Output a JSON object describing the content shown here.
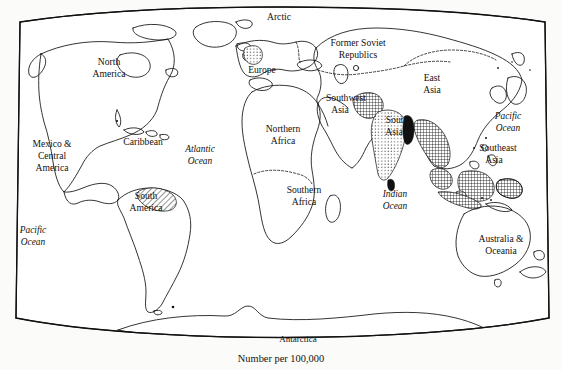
{
  "figure": {
    "type": "choropleth-world-map",
    "caption": "Number per 100,000",
    "projection": "elliptical",
    "background_color": "#fbfbf9",
    "line_color": "#111111"
  },
  "regions": [
    {
      "id": "arctic",
      "label": "Arctic",
      "line1": "Arctic",
      "line2": "",
      "x": 279,
      "y": 18,
      "shading": "none"
    },
    {
      "id": "north-america",
      "label": "North America",
      "line1": "North",
      "line2": "America",
      "x": 109,
      "y": 68,
      "shading": "none"
    },
    {
      "id": "europe",
      "label": "Europe",
      "line1": "Europe",
      "line2": "",
      "x": 259,
      "y": 71,
      "shading": "stipple"
    },
    {
      "id": "former-soviet",
      "label": "Former Soviet Republics",
      "line1": "Former Soviet",
      "line2": "Republics",
      "x": 358,
      "y": 49,
      "shading": "none"
    },
    {
      "id": "east-asia",
      "label": "East Asia",
      "line1": "East",
      "line2": "Asia",
      "x": 432,
      "y": 84,
      "shading": "none"
    },
    {
      "id": "mexico-central",
      "label": "Mexico & Central America",
      "line1": "Mexico &",
      "line2": "Central",
      "line3": "America",
      "x": 52,
      "y": 155,
      "shading": "none"
    },
    {
      "id": "caribbean",
      "label": "Caribbean",
      "line1": "Caribbean",
      "line2": "",
      "x": 143,
      "y": 143,
      "shading": "none"
    },
    {
      "id": "south-america",
      "label": "South America",
      "line1": "South",
      "line2": "America",
      "x": 146,
      "y": 203,
      "shading": "diagonal-hatch"
    },
    {
      "id": "northern-africa",
      "label": "Northern Africa",
      "line1": "Northern",
      "line2": "Africa",
      "x": 283,
      "y": 135,
      "shading": "none"
    },
    {
      "id": "southern-africa",
      "label": "Southern Africa",
      "line1": "Southern",
      "line2": "Africa",
      "x": 304,
      "y": 196,
      "shading": "none"
    },
    {
      "id": "southwest-asia",
      "label": "Southwest Asia",
      "line1": "Southwest",
      "line2": "Asia",
      "x": 345,
      "y": 104,
      "shading": "cross-hatch"
    },
    {
      "id": "south-asia",
      "label": "South Asia",
      "line1": "South",
      "line2": "Asia",
      "x": 397,
      "y": 126,
      "shading": "stipple"
    },
    {
      "id": "southeast-asia",
      "label": "Southeast Asia",
      "line1": "Southeast",
      "line2": "Asia",
      "x": 495,
      "y": 154,
      "shading": "cross-hatch"
    },
    {
      "id": "australia-oceania",
      "label": "Australia & Oceania",
      "line1": "Australia &",
      "line2": "Oceania",
      "x": 501,
      "y": 245,
      "shading": "none"
    },
    {
      "id": "antarctica",
      "label": "Antarctica",
      "line1": "Antarctica",
      "line2": "",
      "x": 298,
      "y": 340,
      "shading": "none"
    }
  ],
  "oceans": [
    {
      "id": "atlantic-ocean",
      "line1": "Atlantic",
      "line2": "Ocean",
      "x": 200,
      "y": 155
    },
    {
      "id": "indian-ocean",
      "line1": "Indian",
      "line2": "Ocean",
      "x": 395,
      "y": 200
    },
    {
      "id": "pacific-ocean-east",
      "line1": "Pacific",
      "line2": "Ocean",
      "x": 508,
      "y": 122
    },
    {
      "id": "pacific-ocean-west",
      "line1": "Pacific",
      "line2": "Ocean",
      "x": 33,
      "y": 236
    }
  ],
  "shading_patterns": {
    "stipple": "fine dots — moderate rate",
    "diagonal-hatch": "parallel diagonal lines",
    "cross-hatch": "dense crossed lines — high rate",
    "solid-black": "solid fill — highest rate"
  }
}
